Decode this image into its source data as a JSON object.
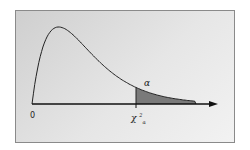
{
  "chart_data": {
    "type": "area",
    "title": "",
    "x_origin_label": "0",
    "critical_value_label": "χ²_α",
    "critical_symbol": "χ",
    "critical_superscript": "2",
    "critical_subscript": "α",
    "shaded_region_label": "α",
    "degrees_of_freedom": 4,
    "xlim": [
      0,
      14
    ],
    "critical_x": 7.8,
    "tail_end_x": 12.3,
    "colors": {
      "curve": "#222222",
      "shaded": "#7a7a7a",
      "axis": "#111111"
    }
  }
}
